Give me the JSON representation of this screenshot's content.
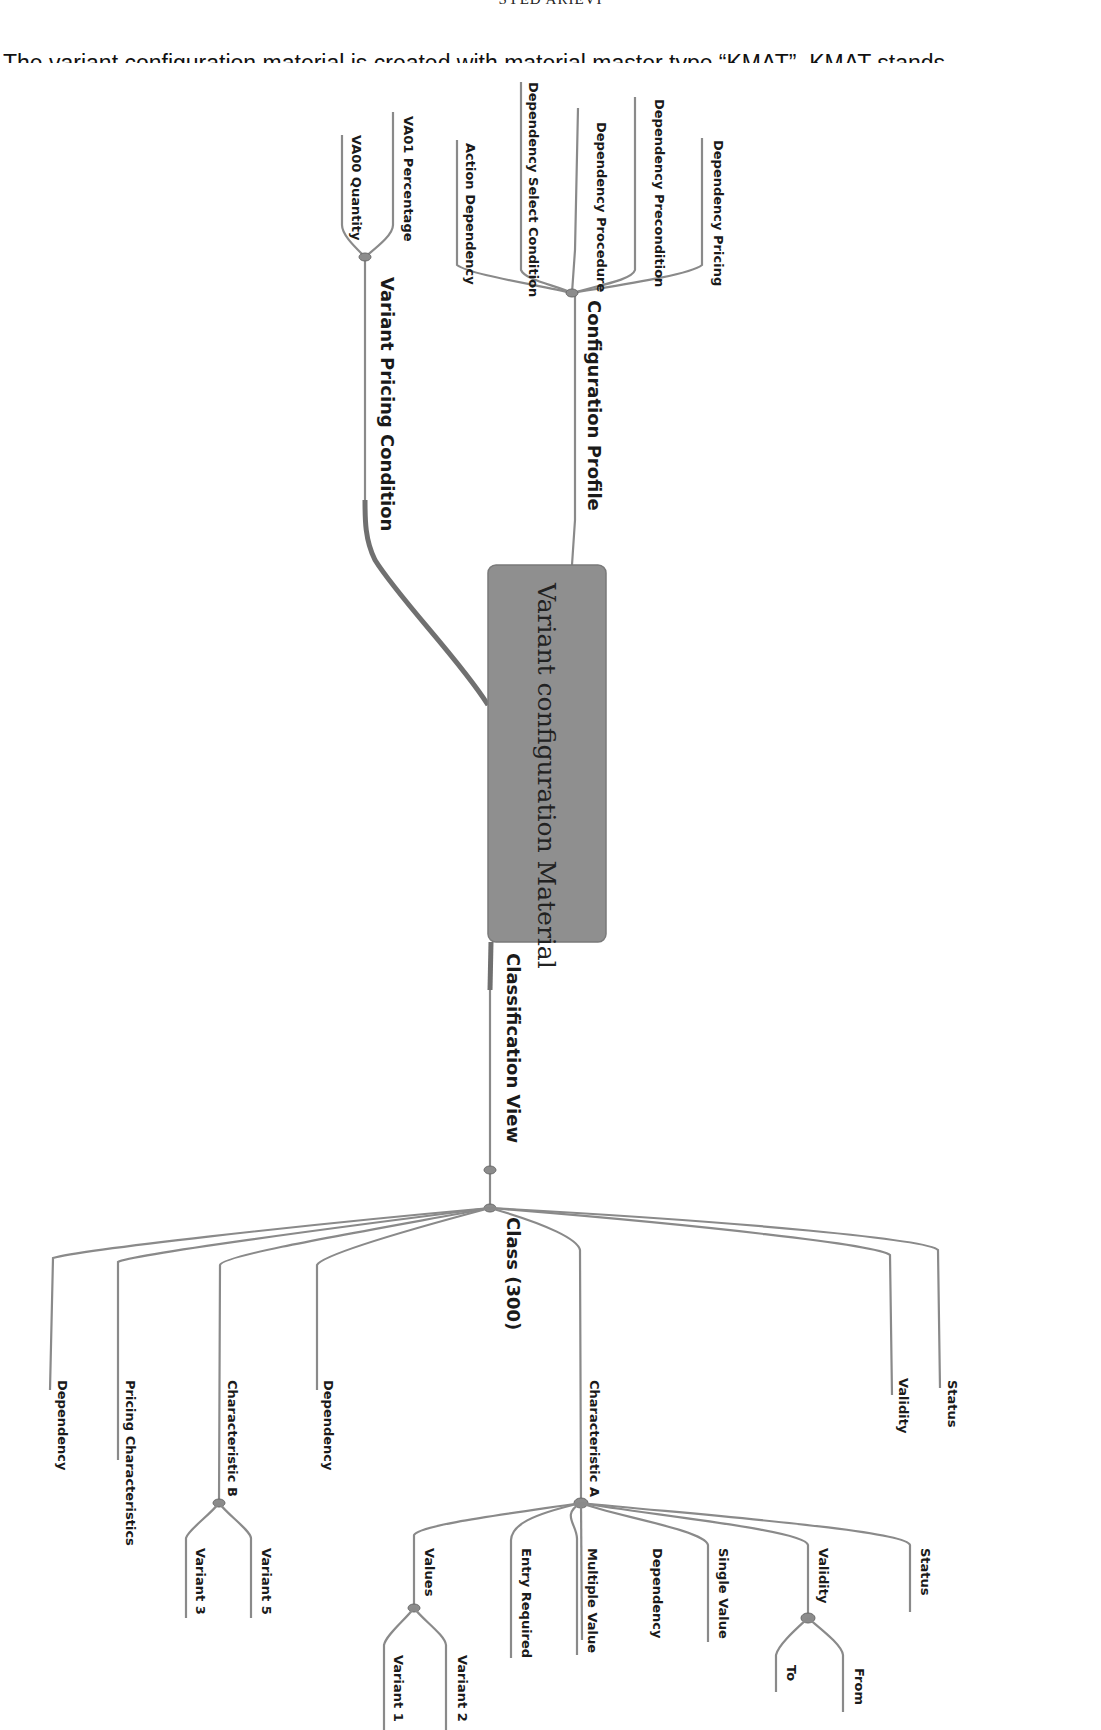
{
  "page": {
    "running_header": "SYED ARIEVI",
    "intro_text": "The variant configuration material is created with material master type “KMAT”. KMAT stands"
  },
  "mindmap": {
    "root": "Variant configuration Material",
    "branches": {
      "configuration_profile": {
        "label": "Configuration Profile",
        "children": [
          "Action Dependency",
          "Dependency Select Condition",
          "Dependency Procedure",
          "Dependency Precondition",
          "Dependency Pricing"
        ]
      },
      "variant_pricing_condition": {
        "label": "Variant Pricing Condition",
        "children": [
          "VA00 Quantity",
          "VA01 Percentage"
        ]
      },
      "classification_view": {
        "label": "Classification View",
        "class": {
          "label": "Class (300)",
          "children": {
            "dependency_1": "Dependency",
            "pricing_characteristics": "Pricing Characteristics",
            "characteristic_b": {
              "label": "Characteristic B",
              "children": [
                "Variant 3",
                "Variant 5"
              ]
            },
            "dependency_2": "Dependency",
            "characteristic_a": {
              "label": "Characteristic A",
              "children": {
                "values": {
                  "label": "Values",
                  "children": [
                    "Variant 1",
                    "Variant 2"
                  ]
                },
                "entry_required": "Entry Required",
                "multiple_value": "Multiple Value",
                "dependency": "Dependency",
                "single_value": "Single Value",
                "validity": {
                  "label": "Validity",
                  "children": [
                    "To",
                    "From"
                  ]
                },
                "status": "Status"
              }
            },
            "validity": "Validity",
            "status": "Status"
          }
        }
      }
    }
  }
}
